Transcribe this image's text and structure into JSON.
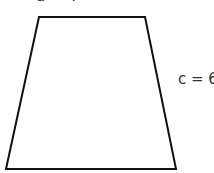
{
  "diagram": {
    "shape": "trapezoid",
    "vertices": {
      "top_left": [
        39,
        17
      ],
      "top_right": [
        145,
        17
      ],
      "bottom_right": [
        176,
        169
      ],
      "bottom_left": [
        6,
        169
      ]
    },
    "stroke_color": "#111111",
    "fill_color": "#ffffff"
  },
  "labels": {
    "top": "a = 4",
    "side": "c = 6"
  }
}
